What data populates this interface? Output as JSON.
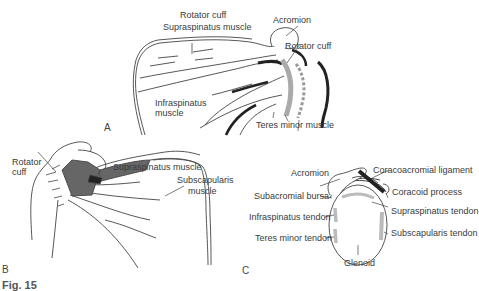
{
  "figure": {
    "caption_visible_fragment": "Fig. 15",
    "panels": {
      "A": {
        "letter": "A",
        "labels": {
          "rotator_cuff_top": "Rotator cuff",
          "supraspinatus": "Supraspinatus muscle",
          "acromion": "Acromion",
          "rotator_cuff_right": "Rotator cuff",
          "infraspinatus_1": "Infraspinatus",
          "infraspinatus_2": "muscle",
          "teres_minor": "Teres minor muscle"
        }
      },
      "B": {
        "letter": "B",
        "labels": {
          "rotator_1": "Rotator",
          "rotator_2": "cuff",
          "supraspinatus": "Supraspinatus muscle",
          "subscapularis_1": "Subscapularis",
          "subscapularis_2": "muscle"
        }
      },
      "C": {
        "letter": "C",
        "labels": {
          "acromion": "Acromion",
          "coracoacromial": "Coracoacromial ligament",
          "coracoid": "Coracoid process",
          "subacromial_bursa": "Subacromial bursa",
          "supraspinatus_tendon": "Supraspinatus tendon",
          "infraspinatus_tendon": "Infraspinatus tendon",
          "subscapularis_tendon": "Subscapularis tendon",
          "teres_minor_tendon": "Teres minor tendon",
          "glenoid": "Glenoid"
        }
      }
    }
  }
}
